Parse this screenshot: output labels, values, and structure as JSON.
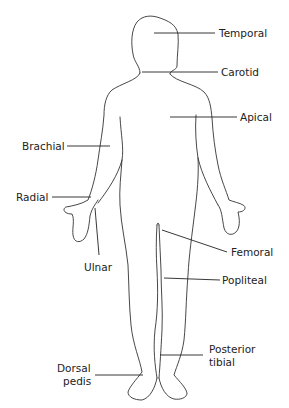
{
  "labels": {
    "temporal": "Temporal",
    "carotid": "Carotid",
    "apical": "Apical",
    "brachial": "Brachial",
    "radial": "Radial",
    "ulnar": "Ulnar",
    "femoral": "Femoral",
    "popliteal": "Popliteal",
    "posterior_tibial_1": "Posterior",
    "posterior_tibial_2": "tibial",
    "dorsal_pedis_1": "Dorsal",
    "dorsal_pedis_2": "pedis"
  },
  "colors": {
    "line": "#333333",
    "text": "#222222",
    "background": "#ffffff"
  }
}
